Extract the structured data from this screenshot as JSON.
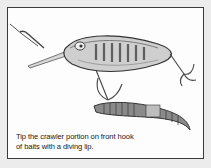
{
  "figure": {
    "illustration": "crankbait-lure-with-nightcrawler-on-front-hook",
    "caption": {
      "line1": "Tip the crawler portion on front hook",
      "line2": "of baits with a diving lip."
    },
    "colors": {
      "background": "#ececec",
      "frame": "#3a3a3a",
      "panel": "#fdfdfd",
      "text": "#222222"
    }
  }
}
